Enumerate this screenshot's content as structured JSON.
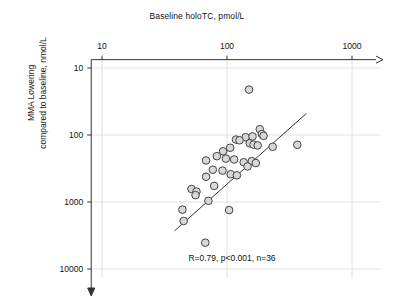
{
  "chart_data": {
    "type": "scatter",
    "title": "",
    "xlabel": "Baseline holoTC, pmol/L",
    "ylabel": "MMA Lowering compared to baseline, nmol/L",
    "ylabel_lines": [
      "MMA Lowering",
      "compared to baseline, nmol/L"
    ],
    "xscale": "log",
    "yscale": "log",
    "y_inverted": true,
    "xlim": [
      8.2,
      1700
    ],
    "ylim": [
      7.5,
      13500
    ],
    "xticks": [
      10,
      100,
      1000
    ],
    "xticklabels": [
      "10",
      "100",
      "1000"
    ],
    "yticks": [
      10,
      100,
      1000,
      10000
    ],
    "yticklabels": [
      "10",
      "100",
      "1000",
      "10000"
    ],
    "grid": true,
    "legend": null,
    "annotation": "R=0.79, p<0.001, n=36",
    "stats": {
      "R": 0.79,
      "p_text": "p<0.001",
      "n": 36
    },
    "marker": {
      "shape": "circle",
      "fill": "#d8d8d8",
      "edge": "#444444",
      "size_px": 7.6
    },
    "trendline": {
      "visible": true,
      "color": "#333333",
      "x_start": 38,
      "y_start": 2700,
      "x_end": 430,
      "y_end": 48
    },
    "points": [
      {
        "x": 150,
        "y": 21
      },
      {
        "x": 183,
        "y": 82
      },
      {
        "x": 190,
        "y": 97
      },
      {
        "x": 196,
        "y": 103
      },
      {
        "x": 141,
        "y": 108
      },
      {
        "x": 160,
        "y": 105
      },
      {
        "x": 118,
        "y": 117
      },
      {
        "x": 126,
        "y": 120
      },
      {
        "x": 152,
        "y": 133
      },
      {
        "x": 163,
        "y": 139
      },
      {
        "x": 176,
        "y": 143
      },
      {
        "x": 232,
        "y": 150
      },
      {
        "x": 365,
        "y": 140
      },
      {
        "x": 106,
        "y": 155
      },
      {
        "x": 93,
        "y": 175
      },
      {
        "x": 83,
        "y": 207
      },
      {
        "x": 98,
        "y": 225
      },
      {
        "x": 114,
        "y": 232
      },
      {
        "x": 68,
        "y": 240
      },
      {
        "x": 158,
        "y": 246
      },
      {
        "x": 136,
        "y": 255
      },
      {
        "x": 170,
        "y": 262
      },
      {
        "x": 146,
        "y": 295
      },
      {
        "x": 77,
        "y": 330
      },
      {
        "x": 92,
        "y": 340
      },
      {
        "x": 107,
        "y": 385
      },
      {
        "x": 120,
        "y": 400
      },
      {
        "x": 68,
        "y": 420
      },
      {
        "x": 79,
        "y": 575
      },
      {
        "x": 52,
        "y": 640
      },
      {
        "x": 57,
        "y": 700
      },
      {
        "x": 56,
        "y": 790
      },
      {
        "x": 71,
        "y": 960
      },
      {
        "x": 104,
        "y": 1320
      },
      {
        "x": 44,
        "y": 1300
      },
      {
        "x": 45,
        "y": 1920
      },
      {
        "x": 67,
        "y": 4050
      }
    ]
  }
}
